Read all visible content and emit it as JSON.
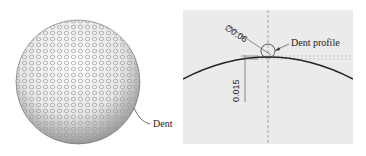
{
  "figure": {
    "left_panel": {
      "subject": "golf-ball",
      "callout_label": "Dent"
    },
    "right_panel": {
      "diameter_dimension": "∅0.06",
      "depth_dimension": "0.015",
      "callout_label": "Dent profile"
    }
  }
}
